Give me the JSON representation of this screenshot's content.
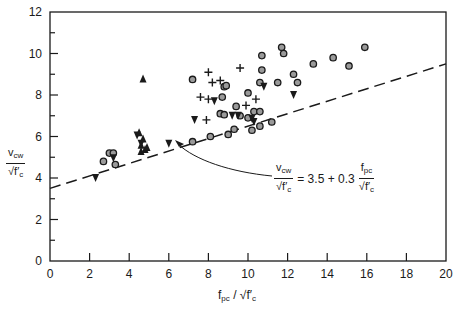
{
  "chart_data": {
    "type": "scatter",
    "title": "",
    "xlabel": "f_pc / sqrt(f'c)",
    "ylabel": "v_cw / sqrt(f'c)",
    "xlim": [
      0,
      20
    ],
    "ylim": [
      0,
      12
    ],
    "x_ticks": [
      0,
      2,
      4,
      6,
      8,
      10,
      12,
      14,
      16,
      18,
      20
    ],
    "y_ticks": [
      0,
      2,
      4,
      6,
      8,
      10,
      12
    ],
    "grid": false,
    "legend": null,
    "series": [
      {
        "name": "circle",
        "marker": "circle",
        "points": [
          [
            2.7,
            4.8
          ],
          [
            3.0,
            5.2
          ],
          [
            3.2,
            5.2
          ],
          [
            3.3,
            4.65
          ],
          [
            7.2,
            5.75
          ],
          [
            8.1,
            6.0
          ],
          [
            9.0,
            6.1
          ],
          [
            9.3,
            6.35
          ],
          [
            10.2,
            6.3
          ],
          [
            10.6,
            6.5
          ],
          [
            11.2,
            6.7
          ],
          [
            7.2,
            8.75
          ],
          [
            8.7,
            7.9
          ],
          [
            8.8,
            8.4
          ],
          [
            8.9,
            8.45
          ],
          [
            8.6,
            7.1
          ],
          [
            8.8,
            7.05
          ],
          [
            9.4,
            7.45
          ],
          [
            9.6,
            7.0
          ],
          [
            10.3,
            7.2
          ],
          [
            10.6,
            7.2
          ],
          [
            10.0,
            8.1
          ],
          [
            10.0,
            6.9
          ],
          [
            10.6,
            8.6
          ],
          [
            10.7,
            9.2
          ],
          [
            10.7,
            9.9
          ],
          [
            11.5,
            8.6
          ],
          [
            11.7,
            10.3
          ],
          [
            11.8,
            10.0
          ],
          [
            12.5,
            8.6
          ],
          [
            13.3,
            9.5
          ],
          [
            12.3,
            9.0
          ],
          [
            14.3,
            9.8
          ],
          [
            15.1,
            9.4
          ],
          [
            15.9,
            10.3
          ]
        ]
      },
      {
        "name": "plus",
        "marker": "plus",
        "points": [
          [
            8.0,
            9.1
          ],
          [
            8.2,
            8.6
          ],
          [
            8.6,
            8.7
          ],
          [
            9.6,
            9.3
          ],
          [
            7.6,
            7.9
          ],
          [
            8.0,
            7.8
          ],
          [
            7.9,
            6.8
          ],
          [
            9.9,
            7.5
          ],
          [
            10.4,
            7.8
          ]
        ]
      },
      {
        "name": "triangle-down",
        "marker": "triangle-down",
        "points": [
          [
            2.3,
            4.0
          ],
          [
            3.2,
            4.95
          ],
          [
            4.4,
            6.05
          ],
          [
            4.6,
            5.65
          ],
          [
            6.0,
            5.65
          ],
          [
            7.3,
            6.8
          ],
          [
            8.3,
            7.7
          ],
          [
            9.2,
            7.0
          ],
          [
            9.5,
            7.0
          ],
          [
            10.3,
            6.7
          ],
          [
            10.8,
            8.4
          ],
          [
            12.3,
            8.0
          ],
          [
            10.2,
            6.85
          ]
        ]
      },
      {
        "name": "triangle-up",
        "marker": "triangle-up",
        "points": [
          [
            4.7,
            8.8
          ],
          [
            4.5,
            6.2
          ],
          [
            4.7,
            5.9
          ],
          [
            4.6,
            5.6
          ],
          [
            4.8,
            5.4
          ],
          [
            4.9,
            5.5
          ],
          [
            4.6,
            5.3
          ]
        ]
      }
    ],
    "lines": [
      {
        "name": "design equation",
        "style": "dashed",
        "intercept": 3.5,
        "slope": 0.3,
        "x": [
          0,
          20
        ],
        "y": [
          3.5,
          9.5
        ]
      }
    ],
    "annotation": {
      "text": "v_cw / sqrt(f'c) = 3.5 + 0.3 f_pc / sqrt(f'c)",
      "arrow_to": [
        6.4,
        5.5
      ]
    }
  },
  "labels": {
    "y_num": "v",
    "y_num_sub": "cw",
    "y_den": "√f′",
    "y_den_sub": "c",
    "x_f": "f",
    "x_f_sub": "pc",
    "x_slash": " / √f′",
    "x_c_sub": "c",
    "eq_equals": "= 3.5 + 0.3",
    "eq_num": "f",
    "eq_num_sub": "pc"
  }
}
